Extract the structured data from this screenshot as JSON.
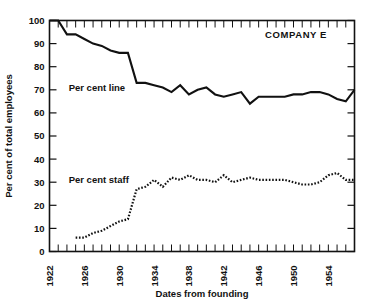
{
  "chart_data": {
    "type": "line",
    "title": "",
    "annotation": "COMPANY E",
    "xlabel": "Dates from founding",
    "ylabel": "Per cent of total employees",
    "xlim": [
      1922,
      1957
    ],
    "ylim": [
      0,
      100
    ],
    "grid": false,
    "legend_position": "inline-annotation",
    "y_ticks": [
      0,
      10,
      20,
      30,
      40,
      50,
      60,
      70,
      80,
      90,
      100
    ],
    "y_tick_labels": [
      "0",
      "10",
      "20",
      "30",
      "40",
      "50",
      "60",
      "70",
      "80",
      "90",
      "100"
    ],
    "x_ticks": [
      1922,
      1923,
      1924,
      1925,
      1926,
      1927,
      1928,
      1929,
      1930,
      1931,
      1932,
      1933,
      1934,
      1935,
      1936,
      1937,
      1938,
      1939,
      1940,
      1941,
      1942,
      1943,
      1944,
      1945,
      1946,
      1947,
      1948,
      1949,
      1950,
      1951,
      1952,
      1953,
      1954,
      1955,
      1956,
      1957
    ],
    "x_tick_labels": [
      "1922",
      "1926",
      "1930",
      "1934",
      "1938",
      "1942",
      "1946",
      "1950",
      "1954"
    ],
    "x_labeled_ticks": [
      1922,
      1926,
      1930,
      1934,
      1938,
      1942,
      1946,
      1950,
      1954
    ],
    "series": [
      {
        "name": "Per cent line",
        "style": "solid",
        "x": [
          1922,
          1923,
          1924,
          1925,
          1926,
          1927,
          1928,
          1929,
          1930,
          1931,
          1932,
          1933,
          1934,
          1935,
          1936,
          1937,
          1938,
          1939,
          1940,
          1941,
          1942,
          1943,
          1944,
          1945,
          1946,
          1947,
          1948,
          1949,
          1950,
          1951,
          1952,
          1953,
          1954,
          1955,
          1956,
          1957
        ],
        "values": [
          100,
          100,
          94,
          94,
          92,
          90,
          89,
          87,
          86,
          86,
          73,
          73,
          72,
          71,
          69,
          72,
          68,
          70,
          71,
          68,
          67,
          68,
          69,
          64,
          67,
          67,
          67,
          67,
          68,
          68,
          69,
          69,
          68,
          66,
          65,
          70
        ]
      },
      {
        "name": "Per cent staff",
        "style": "dotted",
        "x": [
          1925,
          1926,
          1927,
          1928,
          1929,
          1930,
          1931,
          1932,
          1933,
          1934,
          1935,
          1936,
          1937,
          1938,
          1939,
          1940,
          1941,
          1942,
          1943,
          1944,
          1945,
          1946,
          1947,
          1948,
          1949,
          1950,
          1951,
          1952,
          1953,
          1954,
          1955,
          1956,
          1957
        ],
        "values": [
          6,
          6,
          8,
          9,
          11,
          13,
          14,
          27,
          28,
          31,
          28,
          32,
          31,
          33,
          31,
          31,
          30,
          33,
          30,
          31,
          32,
          31,
          31,
          31,
          31,
          30,
          29,
          29,
          30,
          33,
          34,
          31,
          31
        ]
      }
    ],
    "series_labels": [
      {
        "text": "Per cent line",
        "x": 1924.2,
        "y": 71
      },
      {
        "text": "Per cent staff",
        "x": 1924.2,
        "y": 31
      }
    ]
  }
}
